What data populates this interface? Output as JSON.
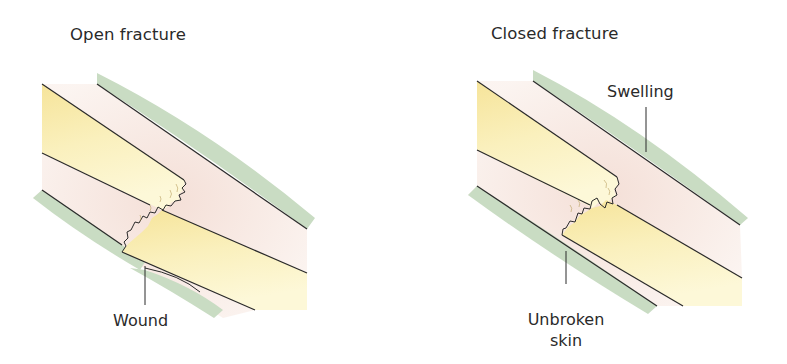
{
  "figure": {
    "panels": [
      {
        "title": "Open fracture",
        "labels": {
          "wound": "Wound"
        }
      },
      {
        "title": "Closed fracture",
        "labels": {
          "swelling": "Swelling",
          "unbroken_skin_line1": "Unbroken",
          "unbroken_skin_line2": "skin"
        }
      }
    ],
    "colors": {
      "skin": "#c9dcc3",
      "bone": "#f8ecae",
      "bone_light": "#fdf9dc",
      "soft_tissue": "#f6e3dc",
      "outline": "#2a2a2a"
    }
  }
}
